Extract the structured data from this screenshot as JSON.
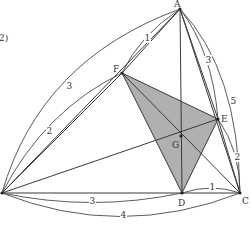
{
  "figure": {
    "caption_fragment": "2)",
    "fill_color": "#b0b0b0",
    "points": {
      "A": {
        "x": 180,
        "y": 9,
        "label": "A",
        "lx": 174,
        "ly": 7
      },
      "B": {
        "x": 2,
        "y": 193,
        "label": "",
        "lx": 0,
        "ly": 0
      },
      "C": {
        "x": 240,
        "y": 193,
        "label": "C",
        "lx": 242,
        "ly": 204
      },
      "D": {
        "x": 182,
        "y": 193,
        "label": "D",
        "lx": 178,
        "ly": 206
      },
      "E": {
        "x": 218,
        "y": 119,
        "label": "E",
        "lx": 221,
        "ly": 122
      },
      "F": {
        "x": 122,
        "y": 73,
        "label": "F",
        "lx": 113,
        "ly": 72
      },
      "G": {
        "x": 181,
        "y": 136,
        "label": "G",
        "lx": 172,
        "ly": 148
      }
    },
    "segment_labels": [
      {
        "text": "3",
        "x": 69,
        "y": 89,
        "note": "arc B-A outer"
      },
      {
        "text": "1",
        "x": 147,
        "y": 41,
        "note": "arc F-A"
      },
      {
        "text": "2",
        "x": 49,
        "y": 134,
        "note": "arc B-F"
      },
      {
        "text": "3",
        "x": 208,
        "y": 63,
        "note": "arc A-E"
      },
      {
        "text": "5",
        "x": 233,
        "y": 104,
        "note": "arc A-C outer"
      },
      {
        "text": "2",
        "x": 237,
        "y": 160,
        "note": "arc E-C"
      },
      {
        "text": "1",
        "x": 212,
        "y": 190,
        "note": "arc D-C"
      },
      {
        "text": "3",
        "x": 92,
        "y": 204,
        "note": "arc B-D"
      },
      {
        "text": "4",
        "x": 123,
        "y": 218,
        "note": "arc B-C outer"
      }
    ]
  }
}
